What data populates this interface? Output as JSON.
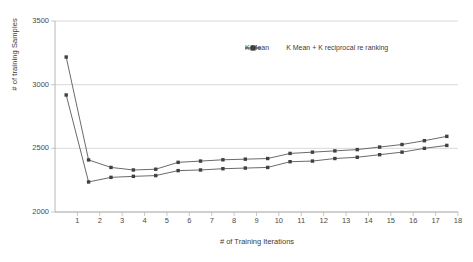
{
  "chart_data": {
    "type": "line",
    "title": "",
    "xlabel": "# of Training Iterations",
    "ylabel": "# of training Samples",
    "x": [
      1,
      2,
      3,
      4,
      5,
      6,
      7,
      8,
      9,
      10,
      11,
      12,
      13,
      14,
      15,
      16,
      17,
      18
    ],
    "xticklabels": [
      "1",
      "2",
      "3",
      "4",
      "5",
      "6",
      "7",
      "8",
      "9",
      "10",
      "11",
      "12",
      "13",
      "14",
      "15",
      "16",
      "17",
      "18"
    ],
    "yticklabels": [
      "2000",
      "2500",
      "3000",
      "3500"
    ],
    "yticks": [
      2000,
      2500,
      3000,
      3500
    ],
    "ylim": [
      2000,
      3500
    ],
    "xlim": [
      0.5,
      18.5
    ],
    "grid": "horizontal",
    "legend_position": "top-center",
    "series": [
      {
        "name": "K Mean",
        "color": "#595959",
        "marker": "square",
        "values": [
          2919,
          2236,
          2272,
          2280,
          2286,
          2325,
          2330,
          2340,
          2345,
          2350,
          2395,
          2400,
          2420,
          2430,
          2450,
          2470,
          2500,
          2523
        ]
      },
      {
        "name": "K Mean + K reciprocal re ranking",
        "color": "#595959",
        "marker": "square",
        "values": [
          3217,
          2409,
          2350,
          2330,
          2336,
          2390,
          2400,
          2410,
          2415,
          2420,
          2460,
          2470,
          2480,
          2490,
          2510,
          2530,
          2560,
          2594
        ]
      }
    ]
  },
  "legend": {
    "entries": [
      {
        "label": "K Mean"
      },
      {
        "label": "K Mean + K reciprocal re ranking"
      }
    ]
  },
  "axes": {
    "y_title": "# of training Samples",
    "x_title": "# of Training Iterations"
  }
}
